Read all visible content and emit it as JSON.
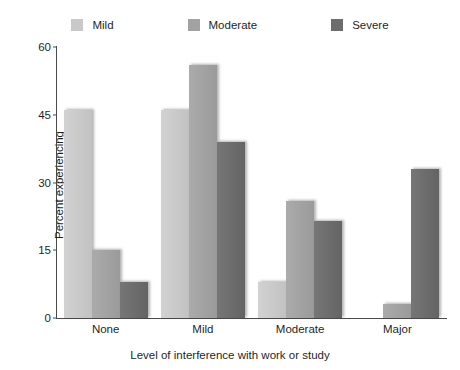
{
  "chart_data": {
    "type": "bar",
    "title": "",
    "xlabel": "Level of interference with work or study",
    "ylabel": "Percent experiencing",
    "categories": [
      "None",
      "Mild",
      "Moderate",
      "Major"
    ],
    "series": [
      {
        "name": "Mild",
        "color": "#c9c9c9",
        "values": [
          46,
          46,
          8,
          0
        ]
      },
      {
        "name": "Moderate",
        "color": "#a2a2a2",
        "values": [
          15,
          56,
          26,
          3
        ]
      },
      {
        "name": "Severe",
        "color": "#6d6d6d",
        "values": [
          8,
          39,
          21.5,
          33
        ]
      }
    ],
    "ylim": [
      0,
      60
    ],
    "yticks": [
      0,
      15,
      30,
      45,
      60
    ],
    "ytick_labels": [
      "0",
      "15",
      "30",
      "45",
      "60"
    ],
    "grid": false,
    "legend_position": "top"
  }
}
